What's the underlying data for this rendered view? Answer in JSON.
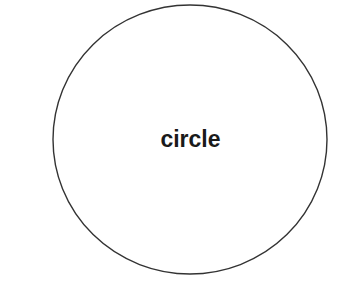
{
  "diagram": {
    "shapes": [
      {
        "type": "circle",
        "label": "circle",
        "stroke": "#333333",
        "fill": "#ffffff"
      }
    ]
  }
}
